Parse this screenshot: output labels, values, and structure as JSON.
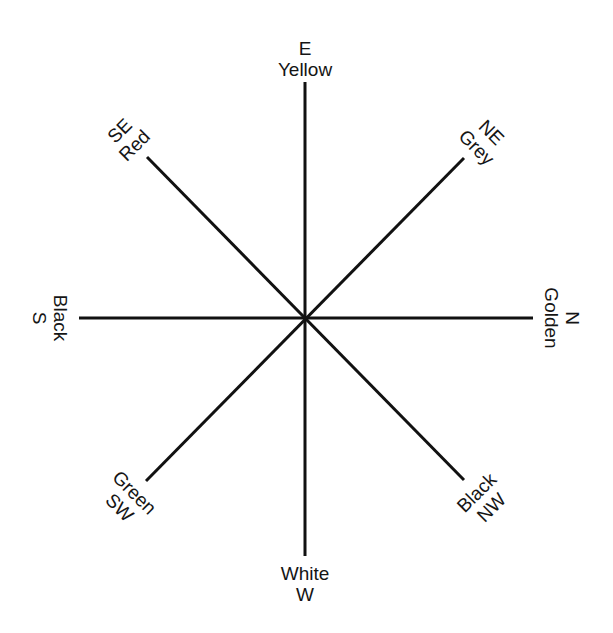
{
  "diagram": {
    "type": "directional-color-compass",
    "center": {
      "x": 305,
      "y": 318
    },
    "line_color": "#111111",
    "directions": [
      {
        "id": "e",
        "direction": "E",
        "color": "Yellow"
      },
      {
        "id": "ne",
        "direction": "NE",
        "color": "Grey"
      },
      {
        "id": "n",
        "direction": "N",
        "color": "Golden"
      },
      {
        "id": "nw",
        "direction": "NW",
        "color": "Black"
      },
      {
        "id": "w",
        "direction": "W",
        "color": "White"
      },
      {
        "id": "sw",
        "direction": "SW",
        "color": "Green"
      },
      {
        "id": "s",
        "direction": "S",
        "color": "Black"
      },
      {
        "id": "se",
        "direction": "SE",
        "color": "Red"
      }
    ]
  }
}
